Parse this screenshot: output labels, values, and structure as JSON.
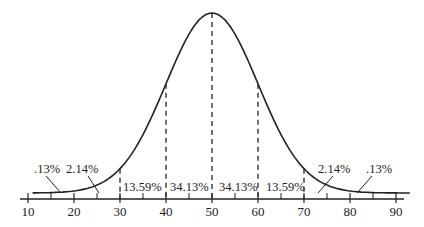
{
  "diagram": {
    "type": "normal-distribution",
    "mean": 50,
    "sd": 10,
    "axis_ticks": [
      "10",
      "20",
      "30",
      "40",
      "50",
      "60",
      "70",
      "80",
      "90"
    ],
    "region_labels": [
      {
        "text": ".13%",
        "region": "below 20"
      },
      {
        "text": "2.14%",
        "region": "20-30"
      },
      {
        "text": "13.59%",
        "region": "30-40"
      },
      {
        "text": "34.13%",
        "region": "40-50"
      },
      {
        "text": "34.13%",
        "region": "50-60"
      },
      {
        "text": "13.59%",
        "region": "60-70"
      },
      {
        "text": "2.14%",
        "region": "70-80"
      },
      {
        "text": ".13%",
        "region": "above 80"
      }
    ],
    "colors": {
      "ink": "#222222",
      "background": "#ffffff"
    }
  }
}
